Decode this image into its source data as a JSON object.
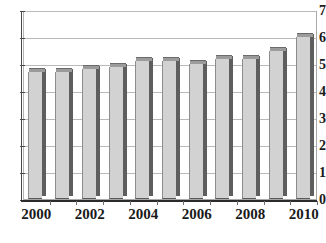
{
  "chart_data": {
    "type": "bar",
    "title": "",
    "subtitle": "",
    "xlabel": "",
    "ylabel": "",
    "categories": [
      "2000",
      "2001",
      "2002",
      "2003",
      "2004",
      "2005",
      "2006",
      "2007",
      "2008",
      "2009",
      "2010"
    ],
    "values": [
      4.7,
      4.7,
      4.8,
      4.9,
      5.1,
      5.1,
      5.0,
      5.2,
      5.2,
      5.5,
      6.0
    ],
    "series": [
      {
        "name": "",
        "values": [
          4.7,
          4.7,
          4.8,
          4.9,
          5.1,
          5.1,
          5.0,
          5.2,
          5.2,
          5.5,
          6.0
        ]
      }
    ],
    "ylim": [
      0,
      7
    ],
    "y_ticks": [
      "0",
      "1",
      "2",
      "3",
      "4",
      "5",
      "6",
      "7"
    ],
    "x_tick_labels": [
      "2000",
      "2002",
      "2004",
      "2006",
      "2008",
      "2010"
    ],
    "x_tick_label_indices": [
      0,
      2,
      4,
      6,
      8,
      10
    ],
    "grid": true,
    "grid_axis": "y",
    "legend": false,
    "legend_position": "none",
    "annotations": [],
    "colors": {
      "bar_face": "#d2d2d2",
      "bar_side": "#5e5e5e",
      "bar_top": "#9b9b9b",
      "gridline": "#b9b9b9",
      "axis": "#2b2b2b",
      "plot_border": "#a8a8a8",
      "text": "#1a1a1a",
      "background": "#ffffff"
    }
  }
}
